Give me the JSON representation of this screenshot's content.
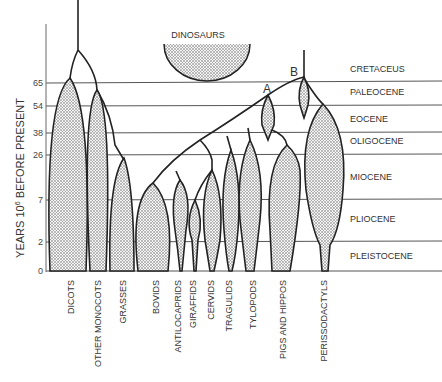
{
  "diagram": {
    "axis_title_main": "YEARS 10",
    "axis_title_sup": "6",
    "axis_title_rest": " BEFORE PRESENT",
    "ticks": [
      "65",
      "54",
      "38",
      "26",
      "7",
      "2",
      "0"
    ],
    "epochs": [
      "CRETACEUS",
      "PALEOCENE",
      "EOCENE",
      "OLIGOCENE",
      "MIOCENE",
      "PLIOCENE",
      "PLEISTOCENE"
    ],
    "dinosaurs_label": "DINOSAURS",
    "node_a": "A",
    "node_b": "B",
    "taxa": [
      "DICOTS",
      "OTHER MONOCOTS",
      "GRASSES",
      "BOVIDS",
      "ANTILOCAPRIDS",
      "GIRAFFIDS",
      "CERVIDS",
      "TRAGULIDS",
      "TYLOPODS",
      "PIGS AND HIPPOS",
      "PERISSODACTYLS"
    ]
  }
}
